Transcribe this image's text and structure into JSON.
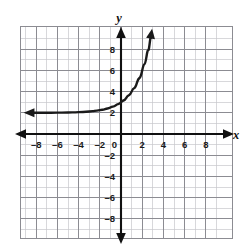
{
  "chart_data": {
    "type": "line",
    "title": "",
    "xlabel": "x",
    "ylabel": "y",
    "xlim": [
      -9,
      9
    ],
    "ylim": [
      -9,
      9
    ],
    "grid": true,
    "grid_minor_step": 1,
    "grid_major_step": 2,
    "legend": "none",
    "xticks": [
      -8,
      -6,
      -4,
      -2,
      0,
      2,
      4,
      6,
      8
    ],
    "xtick_labels": [
      "–8",
      "–6",
      "–4",
      "–2",
      "0",
      "2",
      "4",
      "6",
      "8"
    ],
    "yticks": [
      -8,
      -6,
      -4,
      -2,
      2,
      4,
      6,
      8
    ],
    "ytick_labels": [
      "–8",
      "–6",
      "–4",
      "–2",
      "2",
      "4",
      "6",
      "8"
    ],
    "series": [
      {
        "name": "exponential curve",
        "equation": "y = 2^x + 2",
        "asymptote": 2,
        "y_intercept": 3,
        "arrow_start": "left",
        "arrow_end": "up-right",
        "color": "#1a1a1a",
        "points": [
          {
            "x": -8.6,
            "y": 2.003
          },
          {
            "x": -8.0,
            "y": 2.004
          },
          {
            "x": -7.0,
            "y": 2.008
          },
          {
            "x": -6.0,
            "y": 2.016
          },
          {
            "x": -5.0,
            "y": 2.031
          },
          {
            "x": -4.0,
            "y": 2.063
          },
          {
            "x": -3.0,
            "y": 2.125
          },
          {
            "x": -2.5,
            "y": 2.177
          },
          {
            "x": -2.0,
            "y": 2.25
          },
          {
            "x": -1.5,
            "y": 2.354
          },
          {
            "x": -1.0,
            "y": 2.5
          },
          {
            "x": -0.5,
            "y": 2.707
          },
          {
            "x": 0.0,
            "y": 3.0
          },
          {
            "x": 0.5,
            "y": 3.414
          },
          {
            "x": 1.0,
            "y": 4.0
          },
          {
            "x": 1.5,
            "y": 4.828
          },
          {
            "x": 2.0,
            "y": 6.0
          },
          {
            "x": 2.4,
            "y": 7.28
          },
          {
            "x": 2.7,
            "y": 8.5
          },
          {
            "x": 2.85,
            "y": 9.4
          }
        ]
      }
    ],
    "axes": {
      "x_axis_arrows": [
        "left",
        "right"
      ],
      "y_axis_arrows": [
        "up",
        "down"
      ]
    },
    "colors": {
      "curve": "#1a1a1a",
      "axis": "#111111",
      "grid_minor": "#c8c8cc",
      "grid_major": "#8c8c92",
      "background": "#ffffff",
      "tick_label": "#1a1a1a"
    }
  }
}
